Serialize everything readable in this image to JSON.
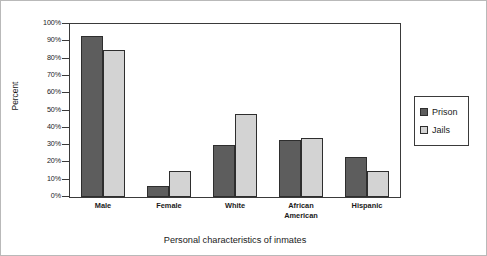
{
  "chart_data": {
    "type": "bar",
    "title": "",
    "xlabel": "Personal characteristics of inmates",
    "ylabel": "Percent",
    "ylim": [
      0,
      100
    ],
    "grid": false,
    "legend_position": "right-outside",
    "categories": [
      "Male",
      "Female",
      "White",
      "African\nAmerican",
      "Hispanic"
    ],
    "ytick_labels": [
      "100%",
      "90%",
      "80%",
      "70%",
      "60%",
      "50%",
      "40%",
      "30%",
      "20%",
      "10%",
      "0%"
    ],
    "ytick_values": [
      100,
      90,
      80,
      70,
      60,
      50,
      40,
      30,
      20,
      10,
      0
    ],
    "series": [
      {
        "name": "Prison",
        "color": "#5d5d5d",
        "values": [
          93,
          6.5,
          30,
          33,
          23
        ]
      },
      {
        "name": "Jails",
        "color": "#d3d3d3",
        "values": [
          85,
          15,
          48,
          34,
          15
        ]
      }
    ]
  },
  "legend": {
    "entries": [
      {
        "label": "Prison",
        "swatch": "dark-gray-swatch"
      },
      {
        "label": "Jails",
        "swatch": "light-gray-swatch"
      }
    ]
  }
}
